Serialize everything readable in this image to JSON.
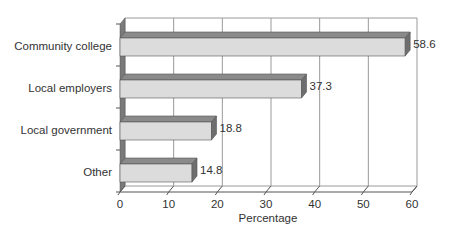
{
  "chart_data": {
    "type": "bar",
    "orientation": "horizontal",
    "style": "3d",
    "title": "",
    "xlabel": "Percentage",
    "ylabel": "",
    "categories": [
      "Community college",
      "Local employers",
      "Local government",
      "Other"
    ],
    "values": [
      58.6,
      37.3,
      18.8,
      14.8
    ],
    "value_labels": [
      "58.6",
      "37.3",
      "18.8",
      "14.8"
    ],
    "xlim": [
      0,
      60
    ],
    "x_ticks": [
      0,
      10,
      20,
      30,
      40,
      50,
      60
    ],
    "x_tick_labels": [
      "0",
      "10",
      "20",
      "30",
      "40",
      "50",
      "60"
    ],
    "grid": true,
    "legend": null
  },
  "colors": {
    "bar_front": "#dcdcdc",
    "bar_top": "#8a8a8a",
    "bar_side": "#6e6e6e",
    "grid": "#9a9a9a",
    "wall": "#7a7a7a",
    "text": "#333333"
  }
}
